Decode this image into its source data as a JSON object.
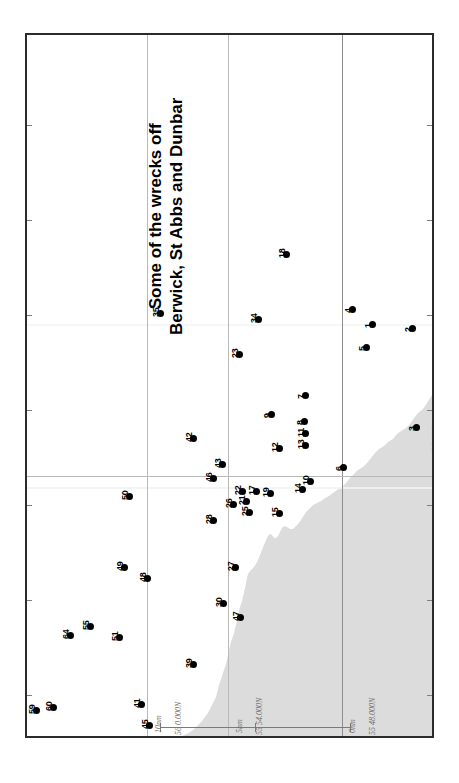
{
  "map": {
    "title_line_1": "Some of the wrecks off",
    "title_line_2": "Berwick, St Abbs and Dunbar",
    "frame_color": "#2b2b2b",
    "land_color": "#dcdcdc",
    "graticule_color": "#b9b9b9",
    "marker_color": "#000000",
    "label_color": "#6e6e6e"
  },
  "coordinate_labels": [
    {
      "text": "56 0.000N",
      "x": 147,
      "y": 700
    },
    {
      "text": "55 54.000N",
      "x": 228,
      "y": 700
    },
    {
      "text": "55 48.000N",
      "x": 341,
      "y": 700
    },
    {
      "text": "2 0.000W",
      "x": 404,
      "y": 417
    }
  ],
  "scale_labels": [
    {
      "text": "10nm",
      "x": 127,
      "y": 700
    },
    {
      "text": "5nm",
      "x": 208,
      "y": 700
    },
    {
      "text": "0nm",
      "x": 321,
      "y": 700
    }
  ],
  "scalebar": {
    "x": 133,
    "y": 722,
    "length": 190,
    "ticks_at": [
      0,
      95,
      190
    ]
  },
  "wrecks": [
    {
      "id": "1",
      "x": 370,
      "y": 322
    },
    {
      "id": "2",
      "x": 410,
      "y": 326
    },
    {
      "id": "3",
      "x": 414,
      "y": 425
    },
    {
      "id": "4",
      "x": 350,
      "y": 307
    },
    {
      "id": "5",
      "x": 364,
      "y": 345
    },
    {
      "id": "6",
      "x": 341,
      "y": 465
    },
    {
      "id": "7",
      "x": 303,
      "y": 393
    },
    {
      "id": "8",
      "x": 302,
      "y": 419
    },
    {
      "id": "9",
      "x": 269,
      "y": 412
    },
    {
      "id": "10",
      "x": 308,
      "y": 479
    },
    {
      "id": "11",
      "x": 303,
      "y": 431
    },
    {
      "id": "12",
      "x": 277,
      "y": 446
    },
    {
      "id": "13",
      "x": 303,
      "y": 443
    },
    {
      "id": "14",
      "x": 300,
      "y": 487
    },
    {
      "id": "15",
      "x": 277,
      "y": 511
    },
    {
      "id": "17",
      "x": 254,
      "y": 489
    },
    {
      "id": "18",
      "x": 284,
      "y": 252
    },
    {
      "id": "19",
      "x": 268,
      "y": 491
    },
    {
      "id": "21",
      "x": 244,
      "y": 499
    },
    {
      "id": "22",
      "x": 240,
      "y": 489
    },
    {
      "id": "23",
      "x": 237,
      "y": 352
    },
    {
      "id": "25",
      "x": 247,
      "y": 510
    },
    {
      "id": "26",
      "x": 231,
      "y": 502
    },
    {
      "id": "27",
      "x": 233,
      "y": 565
    },
    {
      "id": "28",
      "x": 211,
      "y": 518
    },
    {
      "id": "30",
      "x": 221,
      "y": 601
    },
    {
      "id": "34",
      "x": 256,
      "y": 317
    },
    {
      "id": "35",
      "x": 158,
      "y": 311
    },
    {
      "id": "39",
      "x": 191,
      "y": 662
    },
    {
      "id": "41",
      "x": 139,
      "y": 702
    },
    {
      "id": "42",
      "x": 191,
      "y": 436
    },
    {
      "id": "43",
      "x": 220,
      "y": 462
    },
    {
      "id": "45",
      "x": 147,
      "y": 723
    },
    {
      "id": "46",
      "x": 211,
      "y": 476
    },
    {
      "id": "47",
      "x": 238,
      "y": 615
    },
    {
      "id": "48",
      "x": 145,
      "y": 576
    },
    {
      "id": "49",
      "x": 122,
      "y": 565
    },
    {
      "id": "50",
      "x": 127,
      "y": 494
    },
    {
      "id": "51",
      "x": 117,
      "y": 635
    },
    {
      "id": "55",
      "x": 88,
      "y": 624
    },
    {
      "id": "59",
      "x": 34,
      "y": 708
    },
    {
      "id": "60",
      "x": 51,
      "y": 705
    },
    {
      "id": "64",
      "x": 68,
      "y": 633
    }
  ],
  "graticules": {
    "lat_lines_x": [
      120,
      201,
      315
    ],
    "lon_lines_y": [
      441
    ]
  },
  "edge_ticks": {
    "left_y": [
      90,
      185,
      280,
      375,
      470,
      565,
      660
    ],
    "right_y": [
      90,
      185,
      280,
      375,
      470,
      565,
      660
    ]
  }
}
